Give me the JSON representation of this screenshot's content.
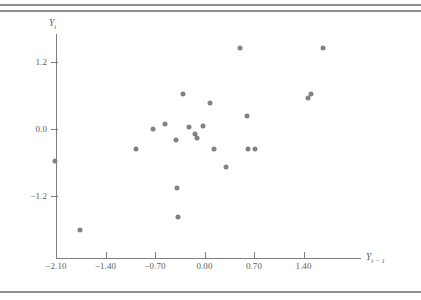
{
  "figure": {
    "type": "scatter-plot",
    "axis_color": "#7c7e81",
    "point_color": "#808285",
    "rule_color": "#8d8f92"
  },
  "axes": {
    "y_title": "Y",
    "y_title_sub": "t",
    "x_title": "Y",
    "x_title_sub": "t − 1",
    "x_ticks": [
      "−2.10",
      "−1.40",
      "−0.70",
      "0.00",
      "0.70",
      "1.40"
    ],
    "x_tick_values": [
      -2.1,
      -1.4,
      -0.7,
      0.0,
      0.7,
      1.4
    ],
    "y_ticks": [
      "1.2",
      "0.0",
      "−1.2"
    ],
    "y_tick_values": [
      1.2,
      0.0,
      -1.2
    ]
  },
  "chart_data": {
    "type": "scatter",
    "title": "",
    "xlabel": "Y_{t-1}",
    "ylabel": "Y_t",
    "xlim": [
      -2.45,
      1.88
    ],
    "ylim": [
      -2.1,
      1.78
    ],
    "grid": false,
    "legend": false,
    "marker": {
      "shape": "circle",
      "size": 5,
      "color": "#808285"
    },
    "points": [
      {
        "x": -2.11,
        "y": -0.58
      },
      {
        "x": -1.76,
        "y": -1.8
      },
      {
        "x": -0.97,
        "y": -0.35
      },
      {
        "x": -0.73,
        "y": 0.0
      },
      {
        "x": -0.56,
        "y": 0.09
      },
      {
        "x": -0.4,
        "y": -0.2
      },
      {
        "x": -0.39,
        "y": -1.05
      },
      {
        "x": -0.38,
        "y": -1.57
      },
      {
        "x": -0.31,
        "y": 0.62
      },
      {
        "x": -0.22,
        "y": 0.03
      },
      {
        "x": -0.14,
        "y": -0.09
      },
      {
        "x": -0.11,
        "y": -0.17
      },
      {
        "x": -0.02,
        "y": 0.05
      },
      {
        "x": 0.08,
        "y": 0.46
      },
      {
        "x": 0.13,
        "y": -0.36
      },
      {
        "x": 0.31,
        "y": -0.68
      },
      {
        "x": 0.5,
        "y": 1.45
      },
      {
        "x": 0.6,
        "y": 0.23
      },
      {
        "x": 0.61,
        "y": -0.36
      },
      {
        "x": 0.72,
        "y": -0.36
      },
      {
        "x": 1.46,
        "y": 0.55
      },
      {
        "x": 1.5,
        "y": 0.63
      },
      {
        "x": 1.68,
        "y": 1.45
      }
    ]
  }
}
